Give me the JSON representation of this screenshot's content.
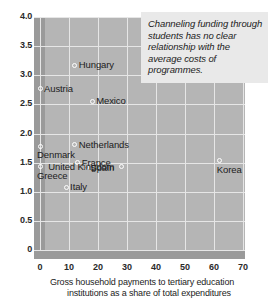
{
  "chart_data": {
    "type": "scatter",
    "title": "",
    "xlabel": "Gross household payments to tertiary education institutions as a share of total expenditures",
    "ylabel": "",
    "xlim": [
      0,
      70
    ],
    "ylim": [
      0,
      4.0
    ],
    "xticks": [
      "0",
      "10",
      "20",
      "30",
      "40",
      "50",
      "60",
      "70"
    ],
    "yticks": [
      "0",
      "0.5",
      "1.0",
      "1.5",
      "2.0",
      "2.5",
      "3.0",
      "3.5",
      "4.0"
    ],
    "grid": true,
    "legend": "none",
    "points": [
      {
        "label": "Hungary",
        "x": 12,
        "y": 3.17,
        "label_side": "right"
      },
      {
        "label": "Austria",
        "x": 0,
        "y": 2.77,
        "label_side": "right"
      },
      {
        "label": "Mexico",
        "x": 18,
        "y": 2.55,
        "label_side": "right"
      },
      {
        "label": "Netherlands",
        "x": 12,
        "y": 1.81,
        "label_side": "right"
      },
      {
        "label": "Denmark",
        "x": 0,
        "y": 1.78,
        "label_side": "below"
      },
      {
        "label": "France",
        "x": 13,
        "y": 1.5,
        "label_side": "right"
      },
      {
        "label": "Greece",
        "x": 0,
        "y": 1.43,
        "label_side": "below"
      },
      {
        "label": "Spain",
        "x": 16,
        "y": 1.41,
        "label_side": "right"
      },
      {
        "label": "United Kingdom",
        "x": 28,
        "y": 1.43,
        "label_side": "left"
      },
      {
        "label": "Korea",
        "x": 62,
        "y": 1.53,
        "label_side": "below"
      },
      {
        "label": "Italy",
        "x": 9,
        "y": 1.08,
        "label_side": "right"
      }
    ],
    "annotation": "Channeling funding through students has no clear relationship with the average costs of programmes."
  },
  "axis": {
    "x_caption_line1": "Gross household payments to tertiary education",
    "x_caption_line2": "institutions as a share of total expenditures"
  },
  "colors": {
    "plot_background": "#b5b5b5",
    "band": "#9a9a9a",
    "gridline": "#e6e6e6",
    "annotation_background": "#e9e9e9",
    "text": "#1c1c1c",
    "marker_outline": "#ffffff"
  }
}
